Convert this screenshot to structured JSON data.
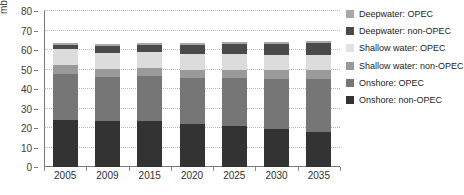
{
  "chart_data": {
    "type": "bar",
    "stacked": true,
    "title": "",
    "xlabel": "",
    "ylabel": "mb/d",
    "ylim": [
      0,
      80
    ],
    "ytick_step": 10,
    "yticks": [
      0,
      10,
      20,
      30,
      40,
      50,
      60,
      70,
      80
    ],
    "grid": true,
    "legend_position": "right",
    "categories": [
      "2005",
      "2009",
      "2015",
      "2020",
      "2025",
      "2030",
      "2035"
    ],
    "series": [
      {
        "name": "Onshore: non-OPEC",
        "color": "#333333",
        "values": [
          24.0,
          23.5,
          23.5,
          22.0,
          21.0,
          19.5,
          18.0
        ]
      },
      {
        "name": "Onshore: OPEC",
        "color": "#767676",
        "values": [
          23.5,
          22.5,
          23.0,
          23.5,
          24.5,
          25.5,
          27.0
        ]
      },
      {
        "name": "Shallow water: non-OPEC",
        "color": "#9a9a9a",
        "values": [
          5.0,
          4.5,
          4.5,
          4.5,
          4.5,
          4.5,
          4.5
        ]
      },
      {
        "name": "Shallow water: OPEC",
        "color": "#dcdcdc",
        "values": [
          8.0,
          8.0,
          8.0,
          8.0,
          8.0,
          8.0,
          8.0
        ]
      },
      {
        "name": "Deepwater: non-OPEC",
        "color": "#4a4a4a",
        "values": [
          2.0,
          3.5,
          3.5,
          4.5,
          5.0,
          5.5,
          6.0
        ]
      },
      {
        "name": "Deepwater: OPEC",
        "color": "#a8a8a8",
        "values": [
          1.0,
          1.0,
          1.0,
          1.0,
          1.0,
          1.0,
          1.0
        ]
      }
    ],
    "totals": [
      69.0,
      67.0,
      67.0,
      66.0,
      66.0,
      66.0,
      66.0
    ]
  },
  "legend": {
    "items": [
      {
        "label": "Deepwater: OPEC",
        "color": "#a8a8a8"
      },
      {
        "label": "Deepwater: non-OPEC",
        "color": "#4a4a4a"
      },
      {
        "label": "Shallow water: OPEC",
        "color": "#e2e2e2"
      },
      {
        "label": "Shallow water: non-OPEC",
        "color": "#9a9a9a"
      },
      {
        "label": "Onshore: OPEC",
        "color": "#767676"
      },
      {
        "label": "Onshore: non-OPEC",
        "color": "#333333"
      }
    ]
  },
  "axis": {
    "y_label": "mb/d"
  },
  "title_strip": ""
}
